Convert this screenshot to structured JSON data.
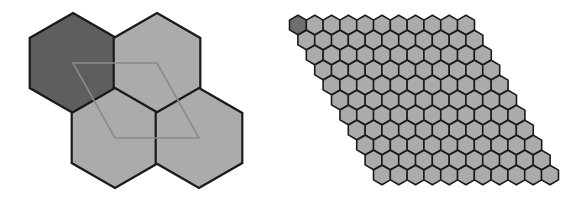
{
  "figure": {
    "width": 586,
    "height": 202,
    "background": "#ffffff"
  },
  "colors": {
    "hex_fill": "#ababab",
    "hex_dark_fill": "#5e5e5e",
    "small_dark_fill": "#6e6e6e",
    "hex_stroke": "#1a1a1a",
    "rhombus_stroke": "#8a8a8a"
  },
  "left_panel": {
    "description": "Four large pointy-top hexagons arranged in a 2x2 rhombic cell with the unit rhombus connecting their centers",
    "hex_radius": 50,
    "hexagons": [
      {
        "cx": 73,
        "cy": 63,
        "shade": "dark"
      },
      {
        "cx": 157,
        "cy": 63,
        "shade": "light"
      },
      {
        "cx": 115,
        "cy": 138,
        "shade": "light"
      },
      {
        "cx": 199,
        "cy": 138,
        "shade": "light"
      }
    ],
    "rhombus": [
      [
        73,
        63
      ],
      [
        157,
        63
      ],
      [
        199,
        138
      ],
      [
        115,
        138
      ]
    ]
  },
  "right_panel": {
    "description": "11 x 11 rhombic tiling of small pointy-top hexagons; first hexagon (top-left) is dark",
    "rows": 11,
    "cols": 11,
    "origin": {
      "cx": 298,
      "cy": 25
    },
    "hex_radius": 9.8,
    "col_step": 16.8,
    "row_step": 15,
    "row_shift": 8.4,
    "dark_cells": [
      [
        0,
        0
      ]
    ]
  }
}
